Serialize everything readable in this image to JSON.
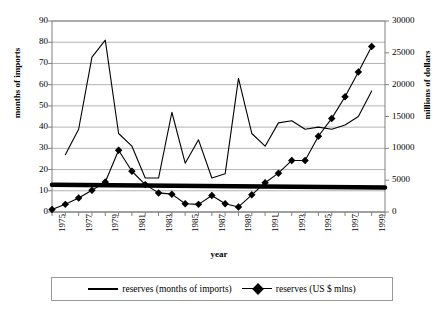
{
  "chart_data": {
    "type": "line",
    "title": "",
    "xlabel": "year",
    "ylabel": "months of imports",
    "y2label": "millions of dollars",
    "xlim": [
      1975,
      2000
    ],
    "ylim": [
      0,
      90
    ],
    "y2lim": [
      0,
      30000
    ],
    "yticks": [
      0,
      10,
      20,
      30,
      40,
      50,
      60,
      70,
      80,
      90
    ],
    "y2ticks": [
      0,
      5000,
      10000,
      15000,
      20000,
      25000,
      30000
    ],
    "xticks": [
      1975,
      1977,
      1979,
      1981,
      1983,
      1985,
      1987,
      1989,
      1991,
      1993,
      1995,
      1997,
      1999
    ],
    "grid": true,
    "legend_position": "bottom",
    "series": [
      {
        "name": "reserves (months of imports)",
        "axis": "left",
        "marker": "none",
        "color": "#000000",
        "x": [
          1976,
          1977,
          1978,
          1979,
          1980,
          1981,
          1982,
          1983,
          1984,
          1985,
          1986,
          1987,
          1988,
          1989,
          1990,
          1991,
          1992,
          1993,
          1994,
          1995,
          1996,
          1997,
          1998,
          1999
        ],
        "values": [
          27,
          39,
          73,
          81,
          37,
          31,
          16,
          16,
          47,
          23,
          34,
          16,
          18,
          63,
          37,
          31,
          42,
          43,
          39,
          40,
          39,
          41,
          45,
          57
        ]
      },
      {
        "name": "reserves (US $ mlns)",
        "axis": "right",
        "marker": "diamond",
        "color": "#000000",
        "x": [
          1975,
          1976,
          1977,
          1978,
          1979,
          1980,
          1981,
          1982,
          1983,
          1984,
          1985,
          1986,
          1987,
          1988,
          1989,
          1990,
          1991,
          1992,
          1993,
          1994,
          1995,
          1996,
          1997,
          1998,
          1999
        ],
        "values": [
          400,
          1200,
          2200,
          3400,
          4700,
          9700,
          6400,
          4300,
          3000,
          2800,
          1300,
          1200,
          2600,
          1300,
          800,
          2700,
          4600,
          6100,
          8100,
          8100,
          11900,
          14700,
          18100,
          22000,
          26000
        ]
      },
      {
        "name": "trend (months of imports)",
        "axis": "left",
        "marker": "none",
        "color": "#000000",
        "thick": true,
        "x": [
          1975,
          2000
        ],
        "values": [
          12.8,
          11.6
        ]
      }
    ]
  }
}
